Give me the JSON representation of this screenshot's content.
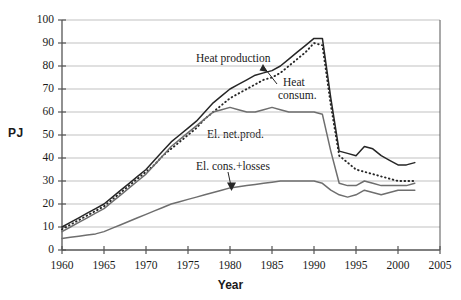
{
  "chart_data": {
    "type": "line",
    "title": "",
    "xlabel": "Year",
    "ylabel": "PJ",
    "xlim": [
      1960,
      2005
    ],
    "ylim": [
      0,
      100
    ],
    "grid": true,
    "grid_axis": "y",
    "legend": "inline-annotations",
    "xticks": [
      "1960",
      "1965",
      "1970",
      "1975",
      "1980",
      "1985",
      "1990",
      "1995",
      "2000",
      "2005"
    ],
    "yticks": [
      "0",
      "10",
      "20",
      "30",
      "40",
      "50",
      "60",
      "70",
      "80",
      "90",
      "100"
    ],
    "x": [
      1960,
      1961,
      1962,
      1963,
      1964,
      1965,
      1966,
      1967,
      1968,
      1969,
      1970,
      1971,
      1972,
      1973,
      1974,
      1975,
      1976,
      1977,
      1978,
      1979,
      1980,
      1981,
      1982,
      1983,
      1984,
      1985,
      1986,
      1987,
      1988,
      1989,
      1990,
      1991,
      1992,
      1993,
      1994,
      1995,
      1996,
      1997,
      1998,
      1999,
      2000,
      2001,
      2002
    ],
    "series": [
      {
        "name": "Heat production",
        "style": "solid",
        "color": "#262626",
        "values": [
          10,
          12,
          14,
          16,
          18,
          20,
          23,
          26,
          29,
          32,
          35,
          39,
          43,
          47,
          50,
          53,
          56,
          60,
          64,
          67,
          70,
          72,
          74,
          76,
          77,
          78,
          80,
          83,
          86,
          89,
          92,
          92,
          66,
          43,
          42,
          41,
          45,
          44,
          41,
          39,
          37,
          37,
          38
        ]
      },
      {
        "name": "Heat consum.",
        "style": "dotted",
        "color": "#262626",
        "values": [
          9,
          11,
          13,
          15,
          17,
          19,
          22,
          25,
          28,
          31,
          34,
          37,
          41,
          44,
          47,
          50,
          53,
          57,
          60,
          63,
          66,
          68,
          70,
          72,
          74,
          75,
          77,
          80,
          83,
          86,
          90,
          89,
          63,
          41,
          38,
          35,
          34,
          33,
          32,
          31,
          30,
          30,
          30
        ]
      },
      {
        "name": "El. net.prod.",
        "style": "solid",
        "color": "#6e6e6e",
        "values": [
          8,
          10,
          12,
          14,
          16,
          18,
          21,
          24,
          27,
          30,
          33,
          37,
          41,
          45,
          48,
          51,
          54,
          57,
          60,
          61,
          62,
          61,
          60,
          60,
          61,
          62,
          61,
          60,
          60,
          60,
          60,
          59,
          43,
          29,
          28,
          28,
          30,
          29,
          28,
          28,
          28,
          28,
          29
        ]
      },
      {
        "name": "El. cons.+losses",
        "style": "solid",
        "color": "#6e6e6e",
        "values": [
          5,
          5.5,
          6,
          6.5,
          7,
          8,
          9.5,
          11,
          12.5,
          14,
          15.5,
          17,
          18.5,
          20,
          21,
          22,
          23,
          24,
          25,
          26,
          27,
          27.5,
          28,
          28.5,
          29,
          29.5,
          30,
          30,
          30,
          30,
          30,
          29,
          26,
          24,
          23,
          24,
          26,
          25,
          24,
          25,
          26,
          26,
          26
        ]
      }
    ],
    "annotations": [
      {
        "text": "Heat production",
        "kind": "label",
        "x_px": 196,
        "y_px": 52
      },
      {
        "text": "Heat",
        "kind": "label",
        "x_px": 283,
        "y_px": 76
      },
      {
        "text": "consum.",
        "kind": "label",
        "x_px": 278,
        "y_px": 89
      },
      {
        "text": "El. net.prod.",
        "kind": "label",
        "x_px": 207,
        "y_px": 128
      },
      {
        "text": "El. cons.+losses",
        "kind": "label",
        "x_px": 196,
        "y_px": 160
      }
    ]
  }
}
